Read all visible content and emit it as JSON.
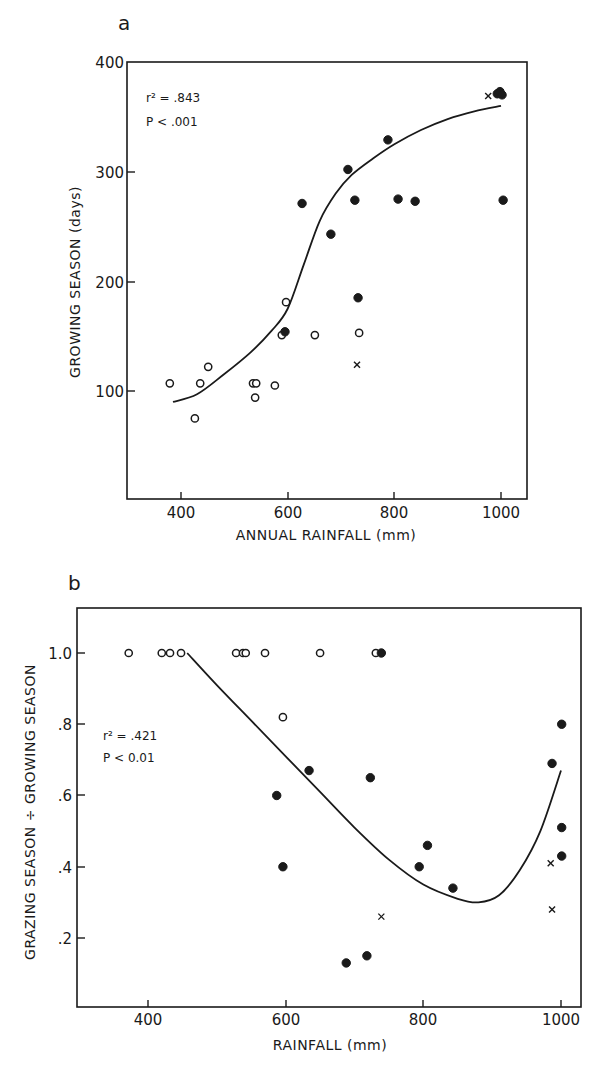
{
  "chart_data": [
    {
      "type": "scatter",
      "panel_label": "a",
      "title": "",
      "xlabel": "ANNUAL RAINFALL (mm)",
      "ylabel": "GROWING SEASON (days)",
      "xlim": [
        300,
        1040
      ],
      "ylim": [
        0,
        400
      ],
      "x_ticks": [
        400,
        600,
        800,
        1000
      ],
      "y_ticks": [
        100,
        200,
        300,
        400
      ],
      "grid": false,
      "annotations": [
        "r² = .843",
        "P < .001"
      ],
      "series": [
        {
          "name": "open circles",
          "marker": "open-circle",
          "points": [
            [
              379,
              107
            ],
            [
              426,
              75
            ],
            [
              436,
              107
            ],
            [
              451,
              122
            ],
            [
              535,
              107
            ],
            [
              541,
              107
            ],
            [
              539,
              94
            ],
            [
              576,
              105
            ],
            [
              589,
              151
            ],
            [
              597,
              181
            ],
            [
              651,
              151
            ],
            [
              734,
              153
            ]
          ]
        },
        {
          "name": "filled circles",
          "marker": "filled-circle",
          "points": [
            [
              595,
              154
            ],
            [
              627,
              271
            ],
            [
              681,
              243
            ],
            [
              713,
              302
            ],
            [
              726,
              274
            ],
            [
              732,
              185
            ],
            [
              788,
              329
            ],
            [
              807,
              275
            ],
            [
              839,
              273
            ],
            [
              1004,
              274
            ],
            [
              993,
              371
            ],
            [
              998,
              373
            ],
            [
              1002,
              370
            ]
          ]
        },
        {
          "name": "crosses",
          "marker": "x",
          "points": [
            [
              730,
              124
            ],
            [
              976,
              369
            ]
          ]
        },
        {
          "name": "fitted curve",
          "marker": "line",
          "points": [
            [
              385,
              90
            ],
            [
              430,
              97
            ],
            [
              480,
              115
            ],
            [
              530,
              135
            ],
            [
              570,
              155
            ],
            [
              600,
              175
            ],
            [
              630,
              215
            ],
            [
              660,
              255
            ],
            [
              690,
              280
            ],
            [
              720,
              297
            ],
            [
              760,
              312
            ],
            [
              800,
              325
            ],
            [
              850,
              338
            ],
            [
              900,
              348
            ],
            [
              950,
              355
            ],
            [
              1000,
              360
            ]
          ]
        }
      ]
    },
    {
      "type": "scatter",
      "panel_label": "b",
      "title": "",
      "xlabel": "RAINFALL (mm)",
      "ylabel": "GRAZING SEASON ÷ GROWING SEASON",
      "xlim": [
        310,
        1030
      ],
      "ylim": [
        0,
        1.12
      ],
      "x_ticks": [
        400,
        600,
        800,
        1000
      ],
      "y_ticks": [
        0.2,
        0.4,
        0.6,
        0.8,
        1.0
      ],
      "y_tick_labels": [
        ".2",
        ".4",
        ".6",
        ".8",
        "1.0"
      ],
      "grid": false,
      "annotations": [
        "r² = .421",
        "P < 0.01"
      ],
      "series": [
        {
          "name": "open circles",
          "marker": "open-circle",
          "points": [
            [
              372,
              1.0
            ],
            [
              420,
              1.0
            ],
            [
              432,
              1.0
            ],
            [
              448,
              1.0
            ],
            [
              528,
              1.0
            ],
            [
              538,
              1.0
            ],
            [
              542,
              1.0
            ],
            [
              570,
              1.0
            ],
            [
              650,
              1.0
            ],
            [
              731,
              1.0
            ],
            [
              596,
              0.82
            ]
          ]
        },
        {
          "name": "filled circles",
          "marker": "filled-circle",
          "points": [
            [
              739,
              1.0
            ],
            [
              587,
              0.6
            ],
            [
              596,
              0.4
            ],
            [
              634,
              0.67
            ],
            [
              688,
              0.13
            ],
            [
              718,
              0.15
            ],
            [
              723,
              0.65
            ],
            [
              794,
              0.4
            ],
            [
              806,
              0.46
            ],
            [
              843,
              0.34
            ],
            [
              987,
              0.69
            ],
            [
              1001,
              0.8
            ],
            [
              1001,
              0.51
            ],
            [
              1001,
              0.43
            ]
          ]
        },
        {
          "name": "crosses",
          "marker": "x",
          "points": [
            [
              739,
              0.26
            ],
            [
              985,
              0.41
            ],
            [
              987,
              0.28
            ]
          ]
        },
        {
          "name": "fitted curve",
          "marker": "line",
          "points": [
            [
              457,
              1.0
            ],
            [
              500,
              0.91
            ],
            [
              550,
              0.81
            ],
            [
              600,
              0.71
            ],
            [
              650,
              0.61
            ],
            [
              700,
              0.51
            ],
            [
              750,
              0.42
            ],
            [
              800,
              0.35
            ],
            [
              850,
              0.31
            ],
            [
              880,
              0.3
            ],
            [
              910,
              0.32
            ],
            [
              940,
              0.39
            ],
            [
              970,
              0.5
            ],
            [
              1000,
              0.67
            ]
          ]
        }
      ]
    }
  ],
  "panel_a": {
    "label": "a",
    "xlabel": "ANNUAL RAINFALL (mm)",
    "ylabel": "GROWING SEASON (days)",
    "x_tick_labels": [
      "400",
      "600",
      "800",
      "1000"
    ],
    "y_tick_labels": [
      "400",
      "300",
      "200",
      "100"
    ],
    "stat_r2": "r² = .843",
    "stat_p": "P < .001"
  },
  "panel_b": {
    "label": "b",
    "xlabel": "RAINFALL (mm)",
    "ylabel": "GRAZING SEASON ÷ GROWING SEASON",
    "x_tick_labels": [
      "400",
      "600",
      "800",
      "1000"
    ],
    "y_tick_labels": [
      "1.0",
      ".8",
      ".6",
      ".4",
      ".2"
    ],
    "stat_r2": "r² = .421",
    "stat_p": "P < 0.01"
  }
}
